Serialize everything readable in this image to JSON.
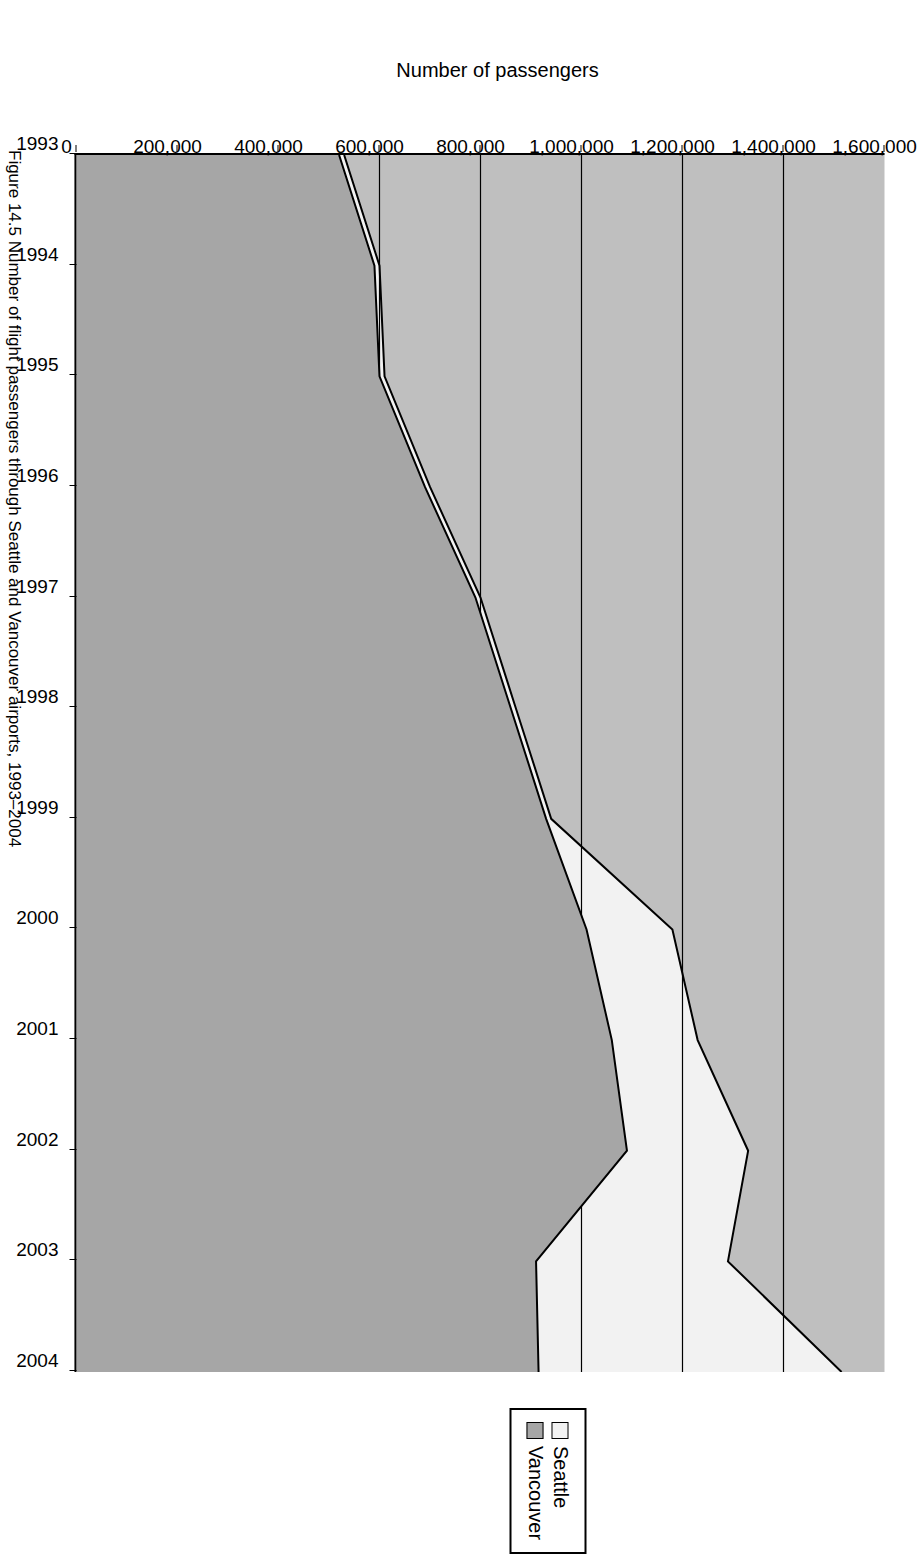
{
  "figure": {
    "caption": "Figure 14.5  Number of flight passengers through Seattle and Vancouver airports, 1993–2004"
  },
  "legend": {
    "position": "top-center",
    "items": [
      {
        "label": "Seattle",
        "color": "#f2f2f2"
      },
      {
        "label": "Vancouver",
        "color": "#a6a6a6"
      }
    ]
  },
  "axes": {
    "y_title": "Number of passengers",
    "y_ticks": [
      "0",
      "200,000",
      "400,000",
      "600,000",
      "800,000",
      "1,000,000",
      "1,200,000",
      "1,400,000",
      "1,600,000"
    ],
    "x_ticks": [
      "1993",
      "1994",
      "1995",
      "1996",
      "1997",
      "1998",
      "1999",
      "2000",
      "2001",
      "2002",
      "2003",
      "2004"
    ]
  },
  "colors": {
    "plot_background": "#bfbfbf",
    "seattle_fill": "#f2f2f2",
    "vancouver_fill": "#a6a6a6",
    "outline": "#000000"
  },
  "chart_data": {
    "type": "area",
    "title": "",
    "subtitle": "",
    "xlabel": "",
    "ylabel": "Number of passengers",
    "orientation": "rotated-90-clockwise",
    "stacked": false,
    "grid": false,
    "legend_position": "top-center",
    "xlim": [
      1993,
      2004
    ],
    "ylim": [
      0,
      1600000
    ],
    "ytick_step": 200000,
    "categories": [
      1993,
      1994,
      1995,
      1996,
      1997,
      1998,
      1999,
      2000,
      2001,
      2002,
      2003,
      2004
    ],
    "series": [
      {
        "name": "Seattle",
        "color": "#f2f2f2",
        "values": [
          530000,
          600000,
          610000,
          700000,
          800000,
          870000,
          940000,
          1180000,
          1230000,
          1330000,
          1290000,
          1515000
        ]
      },
      {
        "name": "Vancouver",
        "color": "#a6a6a6",
        "values": [
          520000,
          590000,
          600000,
          690000,
          790000,
          860000,
          930000,
          1010000,
          1060000,
          1090000,
          910000,
          915000
        ]
      }
    ]
  }
}
